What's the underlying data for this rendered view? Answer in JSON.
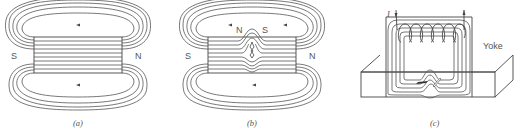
{
  "figures": [
    {
      "id": "a",
      "caption": "(a)",
      "description": "Bar magnet with magnetic flux lines, no defect",
      "pole_left": "S",
      "pole_right": "N"
    },
    {
      "id": "b",
      "caption": "(b)",
      "description": "Bar magnet with surface crack creating leakage field",
      "pole_left": "S",
      "pole_right": "N",
      "defect_pole_left": "N",
      "defect_pole_right": "S"
    },
    {
      "id": "c",
      "caption": "(c)",
      "description": "Yoke magnetization with coil and defect in test piece",
      "yoke_label": "Yoke",
      "current_label": "I"
    }
  ],
  "colors": {
    "line": "#555555",
    "background": "#ffffff"
  }
}
